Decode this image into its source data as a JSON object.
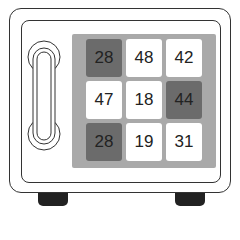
{
  "puzzle": {
    "grid": [
      [
        {
          "value": "28",
          "shade": "dark"
        },
        {
          "value": "48",
          "shade": "light"
        },
        {
          "value": "42",
          "shade": "light"
        }
      ],
      [
        {
          "value": "47",
          "shade": "light"
        },
        {
          "value": "18",
          "shade": "light"
        },
        {
          "value": "44",
          "shade": "dark"
        }
      ],
      [
        {
          "value": "28",
          "shade": "dark"
        },
        {
          "value": "19",
          "shade": "light"
        },
        {
          "value": "31",
          "shade": "light"
        }
      ]
    ],
    "colors": {
      "dark": "#6b6b6b",
      "light": "#ffffff",
      "panel": "#a9a9a9",
      "outline": "#333333",
      "feet": "#222222"
    }
  }
}
